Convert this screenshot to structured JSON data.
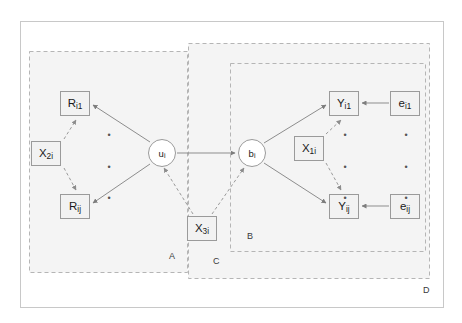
{
  "diagram": {
    "colors": {
      "node_fill": "#f2f2f2",
      "node_border": "#9a9a9a",
      "group_border": "#b5b5b5",
      "group_fill": "#f4f4f4",
      "outer_border": "#c8c8c8",
      "edge_solid": "#8d8d8d",
      "edge_dashed": "#9a9a9a",
      "text": "#1a1a1a"
    },
    "nodes": [
      {
        "id": "R_i1",
        "base": "R",
        "sub": "i1",
        "shape": "rect",
        "x": 60,
        "y": 91,
        "w": 30,
        "h": 25
      },
      {
        "id": "R_ij",
        "base": "R",
        "sub": "ij",
        "shape": "rect",
        "x": 60,
        "y": 194,
        "w": 30,
        "h": 25
      },
      {
        "id": "X_2i",
        "base": "X",
        "sub": "2i",
        "shape": "rect",
        "x": 31,
        "y": 141,
        "w": 30,
        "h": 25
      },
      {
        "id": "u_i",
        "base": "u",
        "sub": "i",
        "shape": "circle",
        "x": 148,
        "y": 139,
        "w": 28,
        "h": 28
      },
      {
        "id": "b_i",
        "base": "b",
        "sub": "i",
        "shape": "circle",
        "x": 238,
        "y": 139,
        "w": 28,
        "h": 28
      },
      {
        "id": "X_3i",
        "base": "X",
        "sub": "3i",
        "shape": "rect",
        "x": 187,
        "y": 216,
        "w": 30,
        "h": 25
      },
      {
        "id": "X_1i",
        "base": "X",
        "sub": "1i",
        "shape": "rect",
        "x": 294,
        "y": 136,
        "w": 30,
        "h": 25
      },
      {
        "id": "Y_i1",
        "base": "Y",
        "sub": "i1",
        "shape": "rect",
        "x": 329,
        "y": 91,
        "w": 30,
        "h": 25
      },
      {
        "id": "Y_ij",
        "base": "Y",
        "sub": "ij",
        "shape": "rect",
        "x": 329,
        "y": 194,
        "w": 30,
        "h": 25
      },
      {
        "id": "e_i1",
        "base": "e",
        "sub": "i1",
        "shape": "rect",
        "x": 390,
        "y": 91,
        "w": 30,
        "h": 25
      },
      {
        "id": "e_ij",
        "base": "e",
        "sub": "ij",
        "shape": "rect",
        "x": 390,
        "y": 194,
        "w": 30,
        "h": 25
      }
    ],
    "edges": [
      {
        "from": "u_i",
        "to": "R_i1",
        "style": "solid",
        "arrow": true
      },
      {
        "from": "u_i",
        "to": "R_ij",
        "style": "solid",
        "arrow": true
      },
      {
        "from": "X_2i",
        "to": "R_i1",
        "style": "dashed",
        "arrow": true
      },
      {
        "from": "X_2i",
        "to": "R_ij",
        "style": "dashed",
        "arrow": true
      },
      {
        "from": "u_i",
        "to": "b_i",
        "style": "solid",
        "arrow": true
      },
      {
        "from": "X_3i",
        "to": "u_i",
        "style": "dashed",
        "arrow": true
      },
      {
        "from": "X_3i",
        "to": "b_i",
        "style": "dashed",
        "arrow": true
      },
      {
        "from": "b_i",
        "to": "Y_i1",
        "style": "solid",
        "arrow": true
      },
      {
        "from": "b_i",
        "to": "Y_ij",
        "style": "solid",
        "arrow": true
      },
      {
        "from": "X_1i",
        "to": "Y_i1",
        "style": "dashed",
        "arrow": true
      },
      {
        "from": "X_1i",
        "to": "Y_ij",
        "style": "dashed",
        "arrow": true
      },
      {
        "from": "e_i1",
        "to": "Y_i1",
        "style": "solid",
        "arrow": true
      },
      {
        "from": "e_ij",
        "to": "Y_ij",
        "style": "solid",
        "arrow": true
      }
    ],
    "groups": [
      {
        "id": "A",
        "label": "A",
        "x": 29,
        "y": 51,
        "w": 159,
        "h": 222,
        "label_x": 169,
        "label_y": 258
      },
      {
        "id": "C",
        "label": "C",
        "x": 188,
        "y": 43,
        "w": 242,
        "h": 236,
        "label_x": 213,
        "label_y": 263
      },
      {
        "id": "B",
        "label": "B",
        "x": 230,
        "y": 63,
        "w": 196,
        "h": 189,
        "label_x": 247,
        "label_y": 238
      },
      {
        "id": "D",
        "label": "D",
        "x": 20,
        "y": 21,
        "w": 424,
        "h": 287,
        "label_x": 423,
        "label_y": 292
      }
    ],
    "ellipses": [
      {
        "id": "left-vertical-dots",
        "x": 103,
        "y": 131,
        "w": 12,
        "h": 72,
        "glyph": "•",
        "count": 3
      },
      {
        "id": "y-vertical-dots",
        "x": 339,
        "y": 131,
        "w": 12,
        "h": 72,
        "glyph": "•",
        "count": 3
      },
      {
        "id": "e-vertical-dots",
        "x": 400,
        "y": 131,
        "w": 12,
        "h": 72,
        "glyph": "•",
        "count": 3
      }
    ]
  }
}
